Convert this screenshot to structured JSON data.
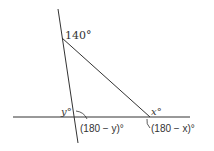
{
  "diagram": {
    "type": "geometry-triangle",
    "labels": {
      "top_angle": "140°",
      "left_interior": "y°",
      "right_interior": "x°",
      "left_exterior": "(180 − y)°",
      "right_exterior": "(180 − x)°"
    },
    "stroke_color": "#333333",
    "background": "#ffffff"
  }
}
